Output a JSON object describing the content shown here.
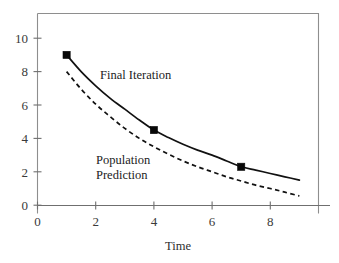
{
  "chart_data": {
    "type": "line",
    "title": "",
    "xlabel": "Time",
    "ylabel": "",
    "xlim": [
      0,
      9.7
    ],
    "ylim": [
      -0.45,
      11.6
    ],
    "grid": false,
    "legend_position": "inline-annotations",
    "x_ticks": [
      0,
      2,
      4,
      6,
      8
    ],
    "x_tick_labels": [
      "0",
      "2",
      "4",
      "6",
      "8"
    ],
    "y_ticks": [
      0,
      2,
      4,
      6,
      8,
      10
    ],
    "y_tick_labels": [
      "0",
      "2",
      "4",
      "6",
      "8",
      "10"
    ],
    "series": [
      {
        "name": "Final Iteration",
        "style": "solid",
        "marker": "filled-square",
        "color": "#111111",
        "x": [
          1.0,
          1.5,
          2.0,
          2.5,
          3.0,
          3.5,
          4.0,
          4.5,
          5.0,
          5.5,
          6.0,
          6.5,
          7.0,
          7.5,
          8.0,
          8.5,
          9.0
        ],
        "y": [
          9.0,
          8.0,
          7.15,
          6.4,
          5.75,
          5.1,
          4.5,
          4.05,
          3.65,
          3.3,
          3.0,
          2.65,
          2.3,
          2.1,
          1.9,
          1.7,
          1.5
        ],
        "data_points": [
          {
            "x": 1,
            "y": 9.0
          },
          {
            "x": 4,
            "y": 4.5
          },
          {
            "x": 7,
            "y": 2.3
          }
        ]
      },
      {
        "name": "Population Prediction",
        "style": "dashed",
        "marker": "none",
        "color": "#111111",
        "x": [
          1.0,
          1.5,
          2.0,
          2.5,
          3.0,
          3.5,
          4.0,
          4.5,
          5.0,
          5.5,
          6.0,
          6.5,
          7.0,
          7.5,
          8.0,
          8.5,
          9.0
        ],
        "y": [
          8.0,
          6.95,
          6.05,
          5.3,
          4.6,
          4.0,
          3.5,
          3.05,
          2.65,
          2.3,
          2.0,
          1.7,
          1.45,
          1.2,
          1.0,
          0.78,
          0.55
        ]
      }
    ],
    "annotations": [
      {
        "text": "Final Iteration",
        "x": 3.3,
        "y": 7.55,
        "lines": [
          "Final Iteration"
        ]
      },
      {
        "text": "Population Prediction",
        "x": 2.6,
        "y": 2.95,
        "lines": [
          "Population",
          "Prediction"
        ]
      }
    ]
  }
}
